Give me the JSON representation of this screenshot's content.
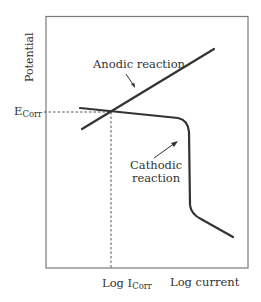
{
  "diagram": {
    "type": "polarization-curve",
    "y_axis_label": "Potential",
    "x_axis_label": "Log current",
    "ecorr_label": {
      "main": "E",
      "sub": "Corr"
    },
    "icorr_label": {
      "main": "Log I",
      "sub": "Corr"
    },
    "curves": [
      {
        "name": "Anodic reaction",
        "label": "Anodic reaction"
      },
      {
        "name": "Cathodic reaction",
        "label_line1": "Cathodic",
        "label_line2": "reaction"
      }
    ],
    "colors": {
      "frame": "#7a7a7a",
      "curve": "#333333",
      "dashed": "#555555",
      "text": "#333333"
    }
  }
}
